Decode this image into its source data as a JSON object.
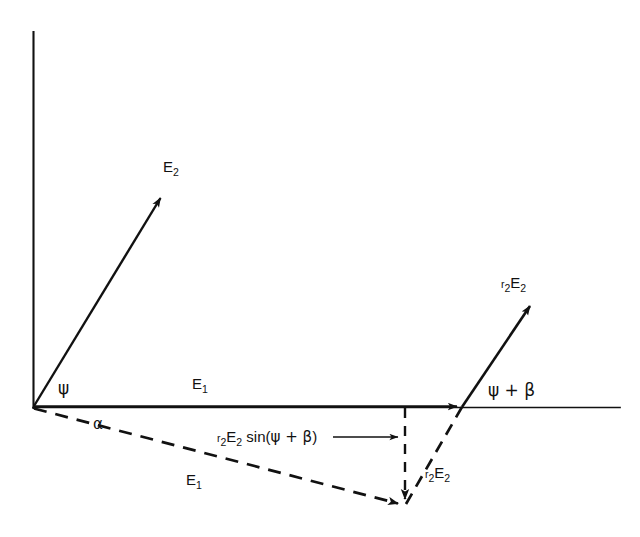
{
  "figure": {
    "background_color": "#ffffff",
    "stroke_color": "#111111"
  },
  "axes": {
    "vertical_axis_name": "vertical-axis",
    "horizontal_axis_name": "horizontal-axis",
    "origin": {
      "x": 33,
      "y": 407
    },
    "vertical_top": {
      "x": 33,
      "y": 32
    },
    "horizontal_right": {
      "x": 620,
      "y": 407
    }
  },
  "labels": {
    "e2_vector": {
      "base": "E",
      "sub": "2"
    },
    "e1_vector_solid": {
      "base": "E",
      "sub": "1"
    },
    "e1_vector_dashed": {
      "base": "E",
      "sub": "1"
    },
    "r2e2_vector": {
      "prefix": "r",
      "prefix_sub": "2",
      "base": "E",
      "sub": "2"
    },
    "r2e2_dashed": {
      "prefix": "r",
      "prefix_sub": "2",
      "base": "E",
      "sub": "2"
    },
    "psi_angle": "ψ",
    "alpha_angle": "α",
    "psi_plus_beta_angle": "ψ + β",
    "projection_annotation": {
      "prefix": "r",
      "prefix_sub": "2",
      "base": "E",
      "sub": "2",
      "func": " sin(",
      "greek": "ψ + β",
      "close": ")"
    }
  },
  "vectors": [
    {
      "name": "E2",
      "style": "solid",
      "from": {
        "x": 33,
        "y": 407
      },
      "to": {
        "x": 163,
        "y": 194
      },
      "arrowhead": true
    },
    {
      "name": "E1",
      "style": "solid",
      "from": {
        "x": 33,
        "y": 407
      },
      "to": {
        "x": 462,
        "y": 407
      },
      "arrowhead": true
    },
    {
      "name": "r2E2",
      "style": "solid",
      "from": {
        "x": 462,
        "y": 407
      },
      "to": {
        "x": 533,
        "y": 302
      },
      "arrowhead": true
    },
    {
      "name": "E1-rotated",
      "style": "dashed",
      "from": {
        "x": 33,
        "y": 407
      },
      "to": {
        "x": 405,
        "y": 505
      },
      "arrowhead": true
    },
    {
      "name": "r2E2-rotated",
      "style": "dashed",
      "from": {
        "x": 405,
        "y": 505
      },
      "to": {
        "x": 462,
        "y": 407
      },
      "arrowhead": false
    },
    {
      "name": "projection-drop-line",
      "style": "dashed",
      "from": {
        "x": 405,
        "y": 407
      },
      "to": {
        "x": 405,
        "y": 505
      },
      "arrowhead": true
    }
  ],
  "annotation_arrow": {
    "name": "projection-leader-arrow",
    "from": {
      "x": 335,
      "y": 437
    },
    "to": {
      "x": 402,
      "y": 437
    }
  }
}
